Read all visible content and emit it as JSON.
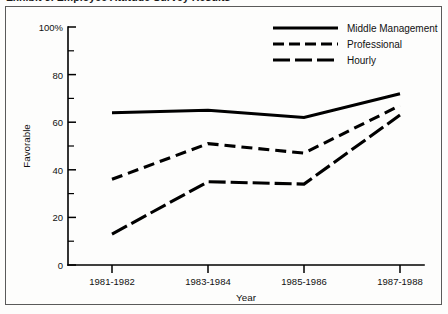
{
  "figure": {
    "cut_off_caption": "Exhibit 3. Employee Attitude Survey Results",
    "border_color": "#5a5a5a",
    "ink_color": "#000000",
    "background": "#ffffff"
  },
  "chart_data": {
    "type": "line",
    "title": "",
    "xlabel": "Year",
    "ylabel": "Favorable",
    "categories": [
      "1981-1982",
      "1983-1984",
      "1985-1986",
      "1987-1988"
    ],
    "ylim": [
      0,
      100
    ],
    "xlim": [
      0,
      1
    ],
    "grid": false,
    "legend_position": "top-right",
    "y_ticks_major": [
      "0",
      "20",
      "40",
      "60",
      "80",
      "100%"
    ],
    "y_tick_values": [
      0,
      20,
      40,
      60,
      80,
      100
    ],
    "y_minor_tick_values": [
      10,
      30,
      50,
      70,
      90
    ],
    "series": [
      {
        "name": "Middle Management",
        "style": "solid",
        "values": [
          64,
          65,
          62,
          72
        ]
      },
      {
        "name": "Professional",
        "style": "dashed",
        "values": [
          36,
          51,
          47,
          67
        ]
      },
      {
        "name": "Hourly",
        "style": "long-dashed",
        "values": [
          13,
          35,
          34,
          63
        ]
      }
    ]
  },
  "legend": {
    "entries": [
      {
        "label": "Middle Management",
        "style": "solid"
      },
      {
        "label": "Professional",
        "style": "dashed"
      },
      {
        "label": "Hourly",
        "style": "long-dashed"
      }
    ]
  }
}
